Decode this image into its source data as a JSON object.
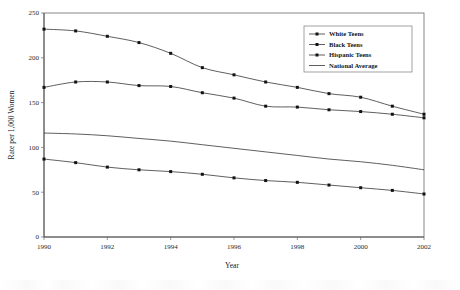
{
  "chart_data": {
    "type": "line",
    "title": "",
    "xlabel": "Year",
    "ylabel": "Rate per 1,000 Women",
    "x": [
      1990,
      1991,
      1992,
      1993,
      1994,
      1995,
      1996,
      1997,
      1998,
      1999,
      2000,
      2001,
      2002
    ],
    "xtick_labels": [
      "1990",
      "1992",
      "1994",
      "1996",
      "1998",
      "2000",
      "2002"
    ],
    "xtick_values": [
      1990,
      1992,
      1994,
      1996,
      1998,
      2000,
      2002
    ],
    "ytick_labels": [
      "0",
      "50",
      "100",
      "150",
      "200",
      "250"
    ],
    "ytick_values": [
      0,
      50,
      100,
      150,
      200,
      250
    ],
    "xlim": [
      1990,
      2002
    ],
    "ylim": [
      0,
      250
    ],
    "grid": false,
    "legend_position": "top-right",
    "series": [
      {
        "name": "White Teens",
        "marker": "square",
        "values": [
          87,
          83,
          78,
          75,
          73,
          70,
          66,
          63,
          61,
          58,
          55,
          52,
          48
        ]
      },
      {
        "name": "Black Teens",
        "marker": "square",
        "values": [
          167,
          173,
          173,
          169,
          168,
          161,
          155,
          146,
          145,
          142,
          140,
          137,
          133
        ]
      },
      {
        "name": "Hispanic Teens",
        "marker": "square",
        "values": [
          232,
          230,
          224,
          217,
          205,
          189,
          181,
          173,
          167,
          160,
          156,
          146,
          137
        ]
      },
      {
        "name": "National Average",
        "marker": "none",
        "values": [
          116,
          115,
          113,
          110,
          107,
          103,
          99,
          95,
          91,
          87,
          84,
          80,
          75
        ]
      }
    ]
  },
  "legend": {
    "entries": [
      {
        "label": "White Teens"
      },
      {
        "label": "Black Teens"
      },
      {
        "label": "Hispanic Teens"
      },
      {
        "label": "National Average"
      }
    ]
  },
  "axes": {
    "x_title": "Year",
    "y_title": "Rate per 1,000 Women"
  }
}
